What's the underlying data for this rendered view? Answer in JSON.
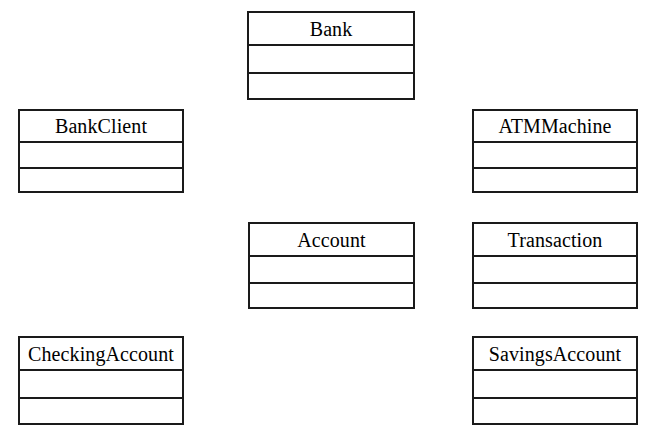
{
  "diagram": {
    "type": "uml-class-diagram",
    "background_color": "#ffffff",
    "border_color": "#1a1a1a",
    "fill_color": "#ffffff",
    "connectors": [],
    "classes": [
      {
        "id": "bank",
        "name": "Bank",
        "attributes": [],
        "operations": [],
        "x": 247,
        "y": 11,
        "width": 168,
        "height": 89,
        "name_compartment_height": 33,
        "attr_compartment_height": 28
      },
      {
        "id": "bank-client",
        "name": "BankClient",
        "attributes": [],
        "operations": [],
        "x": 18,
        "y": 109,
        "width": 166,
        "height": 84,
        "name_compartment_height": 32,
        "attr_compartment_height": 26
      },
      {
        "id": "atm-machine",
        "name": "ATMMachine",
        "attributes": [],
        "operations": [],
        "x": 472,
        "y": 109,
        "width": 166,
        "height": 84,
        "name_compartment_height": 32,
        "attr_compartment_height": 26
      },
      {
        "id": "account",
        "name": "Account",
        "attributes": [],
        "operations": [],
        "x": 248,
        "y": 222,
        "width": 167,
        "height": 87,
        "name_compartment_height": 33,
        "attr_compartment_height": 27
      },
      {
        "id": "transaction",
        "name": "Transaction",
        "attributes": [],
        "operations": [],
        "x": 472,
        "y": 222,
        "width": 166,
        "height": 87,
        "name_compartment_height": 33,
        "attr_compartment_height": 27
      },
      {
        "id": "checking-account",
        "name": "CheckingAccount",
        "attributes": [],
        "operations": [],
        "x": 18,
        "y": 336,
        "width": 166,
        "height": 89,
        "name_compartment_height": 33,
        "attr_compartment_height": 28
      },
      {
        "id": "savings-account",
        "name": "SavingsAccount",
        "attributes": [],
        "operations": [],
        "x": 472,
        "y": 336,
        "width": 166,
        "height": 89,
        "name_compartment_height": 33,
        "attr_compartment_height": 28
      }
    ]
  }
}
